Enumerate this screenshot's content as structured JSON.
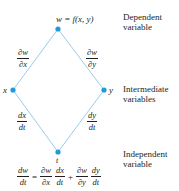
{
  "diagram": {
    "colors": {
      "edge": "#8ec6e6",
      "node": "#1f9bd7",
      "text": "#231f20"
    },
    "nodes": {
      "top": {
        "label": "w = f(x, y)",
        "x": 58,
        "y": 29
      },
      "left": {
        "label": "x",
        "x": 13,
        "y": 90
      },
      "right": {
        "label": "y",
        "x": 104,
        "y": 90
      },
      "bottom": {
        "label": "t",
        "x": 58,
        "y": 152
      }
    },
    "edge_labels": {
      "top_left": {
        "num": "∂w",
        "den": "∂x"
      },
      "top_right": {
        "num": "∂w",
        "den": "∂y"
      },
      "left_bottom": {
        "num": "dx",
        "den": "dt"
      },
      "right_bottom": {
        "num": "dy",
        "den": "dt"
      }
    },
    "side_labels": {
      "dependent": {
        "line1": "Dependent",
        "line2": "variable"
      },
      "intermediate": {
        "line1": "Intermediate",
        "line2": "variables"
      },
      "independent": {
        "line1": "Independent",
        "line2": "variable"
      }
    },
    "equation": {
      "lhs": {
        "num": "dw",
        "den": "dt"
      },
      "equals": "=",
      "t1a": {
        "num": "∂w",
        "den": "∂x"
      },
      "t1b": {
        "num": "dx",
        "den": "dt"
      },
      "plus": "+",
      "t2a": {
        "num": "∂w",
        "den": "∂y"
      },
      "t2b": {
        "num": "dy",
        "den": "dt"
      }
    }
  }
}
